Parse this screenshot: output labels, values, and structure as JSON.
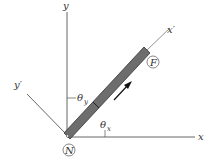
{
  "diagram": {
    "axes": {
      "x": "x",
      "y": "y",
      "x_prime": "x′",
      "y_prime": "y′"
    },
    "angles": {
      "theta_x": "θ",
      "theta_x_sub": "x",
      "theta_y": "θ",
      "theta_y_sub": "y"
    },
    "points": {
      "N": "N",
      "F": "F"
    },
    "colors": {
      "bar": "#6d6d6d",
      "bar_edge": "#333333",
      "axis": "#555555",
      "arrow": "#111111"
    }
  }
}
